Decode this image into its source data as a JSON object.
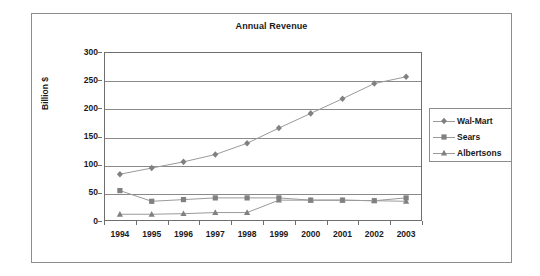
{
  "chart_data": {
    "type": "line",
    "title": "Annual Revenue",
    "xlabel": "",
    "ylabel": "Billion $",
    "categories": [
      "1994",
      "1995",
      "1996",
      "1997",
      "1998",
      "1999",
      "2000",
      "2001",
      "2002",
      "2003"
    ],
    "ylim": [
      0,
      300
    ],
    "yticks": [
      0,
      50,
      100,
      150,
      200,
      250,
      300
    ],
    "ytick_labels": [
      "0",
      "50",
      "100",
      "150",
      "200",
      "250",
      "300"
    ],
    "grid": true,
    "legend_position": "right",
    "series": [
      {
        "name": "Wal-Mart",
        "marker": "diamond",
        "color": "#808080",
        "values": [
          83,
          94,
          105,
          118,
          138,
          165,
          191,
          217,
          244,
          256
        ]
      },
      {
        "name": "Sears",
        "marker": "square",
        "color": "#808080",
        "values": [
          54,
          35,
          38,
          41,
          41,
          41,
          37,
          37,
          36,
          41
        ]
      },
      {
        "name": "Albertsons",
        "marker": "triangle",
        "color": "#808080",
        "values": [
          12,
          12,
          13,
          15,
          15,
          37,
          37,
          37,
          36,
          35
        ]
      }
    ]
  },
  "colors": {
    "series": "#808080",
    "gridline": "#8a8a8a",
    "axis": "#6f6f6f",
    "frame": "#8d8d8d",
    "text": "#1a1a1a",
    "background": "#ffffff"
  }
}
